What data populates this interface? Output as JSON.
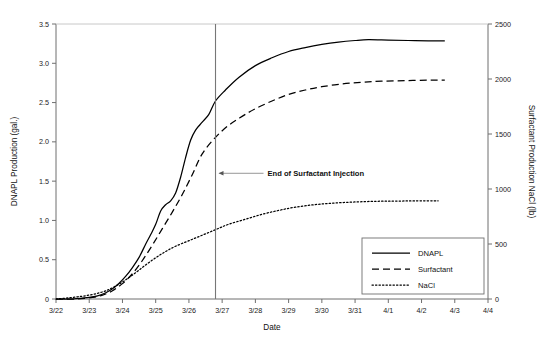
{
  "chart_data": {
    "type": "line",
    "title": "",
    "xlabel": "Date",
    "ylabel": "DNAPL Production (gal.)",
    "y2label": "Surfactant Production NaCl (lb)",
    "grid": false,
    "legend_position": "bottom-right",
    "x_tick_labels": [
      "3/22",
      "3/23",
      "3/24",
      "3/25",
      "3/26",
      "3/27",
      "3/28",
      "3/29",
      "3/30",
      "3/31",
      "4/1",
      "4/2",
      "4/3",
      "4/4"
    ],
    "xlim": [
      0,
      13
    ],
    "ylim": [
      0,
      3.5
    ],
    "y_tick_labels": [
      "0",
      "0.5",
      "1.0",
      "1.5",
      "2.0",
      "2.5",
      "3.0",
      "3.5"
    ],
    "y_tick_values": [
      0,
      0.5,
      1.0,
      1.5,
      2.0,
      2.5,
      3.0,
      3.5
    ],
    "y2lim": [
      0,
      2500
    ],
    "y2_tick_labels": [
      "0",
      "500",
      "1000",
      "1500",
      "2000",
      "2500"
    ],
    "y2_tick_values": [
      0,
      500,
      1000,
      1500,
      2000,
      2500
    ],
    "annotations": [
      {
        "label": "End of Surfactant Injection",
        "x": 4.8,
        "y": 1.6,
        "type": "vertical-line-callout"
      }
    ],
    "series": [
      {
        "name": "DNAPL",
        "axis": "left",
        "style": "solid",
        "x": [
          0.0,
          0.5,
          1.0,
          1.25,
          1.5,
          1.7,
          1.9,
          2.1,
          2.3,
          2.5,
          2.7,
          2.85,
          3.0,
          3.15,
          3.3,
          3.45,
          3.6,
          3.75,
          3.9,
          4.05,
          4.2,
          4.4,
          4.6,
          4.8,
          5.1,
          5.5,
          6.0,
          6.5,
          7.0,
          7.5,
          8.0,
          8.5,
          9.0,
          9.4,
          10.0,
          10.6,
          11.2,
          11.7
        ],
        "y": [
          0.0,
          0.0,
          0.02,
          0.04,
          0.08,
          0.13,
          0.2,
          0.29,
          0.4,
          0.53,
          0.7,
          0.82,
          0.95,
          1.12,
          1.2,
          1.25,
          1.35,
          1.55,
          1.8,
          2.02,
          2.15,
          2.25,
          2.35,
          2.52,
          2.66,
          2.82,
          2.97,
          3.07,
          3.15,
          3.2,
          3.24,
          3.27,
          3.29,
          3.3,
          3.295,
          3.29,
          3.285,
          3.285
        ]
      },
      {
        "name": "Surfactant",
        "axis": "right",
        "style": "dashed",
        "x": [
          0.0,
          0.6,
          1.1,
          1.4,
          1.7,
          2.0,
          2.3,
          2.6,
          2.9,
          3.2,
          3.5,
          3.8,
          4.1,
          4.4,
          4.8,
          5.2,
          5.6,
          6.0,
          6.5,
          7.0,
          7.5,
          8.0,
          8.6,
          9.2,
          9.8,
          10.5,
          11.2,
          11.7
        ],
        "y": [
          0,
          0,
          15,
          35,
          75,
          140,
          230,
          350,
          490,
          640,
          790,
          950,
          1130,
          1320,
          1470,
          1580,
          1660,
          1730,
          1800,
          1860,
          1900,
          1930,
          1955,
          1970,
          1980,
          1985,
          1990,
          1990
        ]
      },
      {
        "name": "NaCl",
        "axis": "right",
        "style": "dotted",
        "x": [
          0.0,
          0.3,
          0.6,
          0.9,
          1.2,
          1.5,
          1.8,
          2.1,
          2.4,
          2.7,
          3.0,
          3.3,
          3.6,
          4.0,
          4.4,
          4.8,
          5.2,
          5.7,
          6.2,
          6.7,
          7.2,
          7.8,
          8.4,
          9.0,
          9.6,
          10.2,
          10.8,
          11.5
        ],
        "y": [
          0,
          8,
          18,
          30,
          48,
          75,
          118,
          175,
          240,
          310,
          375,
          432,
          480,
          530,
          580,
          630,
          680,
          725,
          770,
          805,
          835,
          858,
          873,
          882,
          888,
          890,
          892,
          893
        ]
      }
    ]
  },
  "legend": {
    "items": [
      {
        "label": "DNAPL",
        "style": "solid"
      },
      {
        "label": "Surfactant",
        "style": "dashed"
      },
      {
        "label": "NaCl",
        "style": "dotted"
      }
    ]
  },
  "colors": {
    "line": "#000000",
    "axis": "#6f6f6f",
    "guide": "#777777",
    "background": "#ffffff"
  }
}
